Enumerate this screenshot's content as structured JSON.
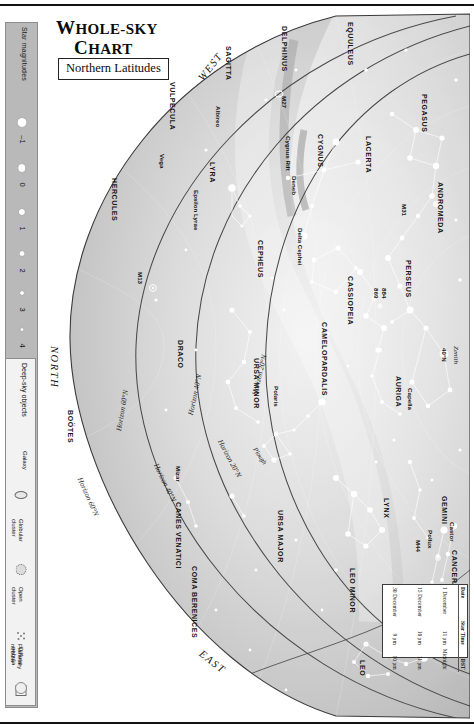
{
  "title": {
    "line1_major": "W",
    "line1_rest": "HOLE-SKY",
    "line2_major": "C",
    "line2_rest": "HART",
    "subtitle": "Northern Latitudes"
  },
  "legend": {
    "magnitudes_label": "Star magnitudes",
    "magnitudes": [
      {
        "value": "–1",
        "size": 9
      },
      {
        "value": "0",
        "size": 7.5
      },
      {
        "value": "1",
        "size": 6.2
      },
      {
        "value": "2",
        "size": 5
      },
      {
        "value": "3",
        "size": 4
      },
      {
        "value": "4",
        "size": 3
      },
      {
        "value": "5",
        "size": 2.2
      }
    ],
    "deepsky_label": "Deep-sky objects",
    "deepsky": [
      {
        "label": "Galaxy",
        "icon": "ellipse-icon"
      },
      {
        "label": "Globular\ncluster",
        "icon": "globular-cluster-icon"
      },
      {
        "label": "Open\ncluster",
        "icon": "open-cluster-icon"
      },
      {
        "label": "Diffuse\nnebula",
        "icon": "square-nebula-icon"
      },
      {
        "label": "Planetary\nnebula",
        "icon": "ring-nebula-icon"
      }
    ]
  },
  "datetable": {
    "headers": [
      "Date",
      "Star Time",
      "DST"
    ],
    "rows": [
      [
        "1 December",
        "11 pm",
        "Midnight"
      ],
      [
        "15 December",
        "10 pm",
        "11 pm"
      ],
      [
        "30 December",
        "9 pm",
        "10 pm"
      ]
    ]
  },
  "cardinals": [
    {
      "name": "WEST",
      "text": "WEST"
    },
    {
      "name": "NORTH",
      "text": "NORTH"
    },
    {
      "name": "EAST",
      "text": "EAST"
    }
  ],
  "horizons": [
    {
      "text": "Horizon 20°N"
    },
    {
      "text": "Horizon 40°N"
    },
    {
      "text": "Horizon 60°N"
    },
    {
      "text": "Horizon 20°N"
    },
    {
      "text": "Horizon 40°N"
    },
    {
      "text": "Horizon 60°N"
    }
  ],
  "zenith": {
    "label": "Zenith",
    "sub": "40°N"
  },
  "ecliptic": {
    "label": "Ecliptic"
  },
  "constellations": [
    "VULPECULA",
    "SAGITTA",
    "DELPHINUS",
    "EQUULEUS",
    "PEGASUS",
    "CYGNUS",
    "LACERTA",
    "ANDROMEDA",
    "HERCULES",
    "LYRA",
    "CEPHEUS",
    "CASSIOPEIA",
    "PERSEUS",
    "DRACO",
    "URSA MINOR",
    "CAMELOPARDALIS",
    "AURIGA",
    "GEMINI",
    "LYNX",
    "CANCER",
    "BOÖTES",
    "CANES VENATICI",
    "URSA MAJOR",
    "COMA BERENICES",
    "LEO MINOR",
    "LEO"
  ],
  "stars": [
    "Albireo",
    "Vega",
    "Deneb",
    "Epsilon Lyrae",
    "Polaris",
    "Mizar",
    "Capella",
    "Castor",
    "Pollux",
    "Regulus",
    "Delta Cephei"
  ],
  "deepsky_objects": [
    "M27",
    "M31",
    "M13",
    "M44",
    "869",
    "884"
  ],
  "features": [
    "Cygnus Rift",
    "Plough"
  ],
  "colors": {
    "legend_bar": "#b9b9b9",
    "sky_light": "#f3f3f3",
    "sky_mid": "#d2d2d2",
    "sky_dark": "#a9a9a9",
    "ink": "#161616",
    "frame": "#111111"
  }
}
